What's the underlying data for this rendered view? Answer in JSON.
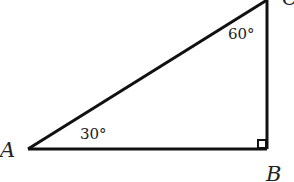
{
  "figure": {
    "type": "right-triangle",
    "vertices": [
      {
        "id": "A",
        "label": "A"
      },
      {
        "id": "B",
        "label": "B"
      },
      {
        "id": "C",
        "label": "C"
      }
    ],
    "angles": {
      "A": "30°",
      "C": "60°",
      "B": "right-angle-marker"
    },
    "colors": {
      "stroke": "#111111",
      "text": "#222222",
      "background": "#ffffff"
    }
  }
}
